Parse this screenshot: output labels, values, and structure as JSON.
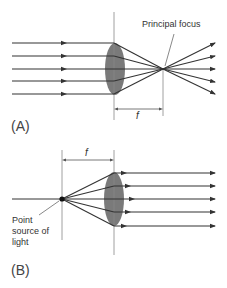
{
  "figure": {
    "panel_a": {
      "label": "(A)",
      "annotation": "Principal focus",
      "dimension_label": "f",
      "description": "Parallel rays converge through convex lens to principal focus"
    },
    "panel_b": {
      "label": "(B)",
      "annotation_lines": [
        "Point",
        "source of",
        "light"
      ],
      "dimension_label": "f",
      "description": "Rays from point source at focal point emerge parallel from convex lens"
    },
    "colors": {
      "ray": "#333333",
      "lens_fill": "#7a7a7a",
      "guide_line": "#888888",
      "text": "#333333"
    }
  }
}
